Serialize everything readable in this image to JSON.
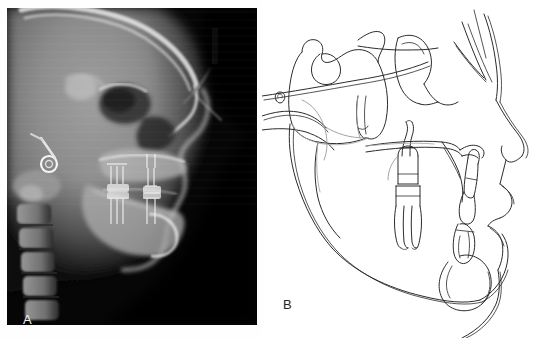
{
  "figure": {
    "type": "two-panel medical imaging figure",
    "background_color": "#fefefe",
    "width": 546,
    "height": 338
  },
  "panel_a": {
    "label": "A",
    "label_color": "#efefef",
    "caption_position": "bottom-left",
    "modality": "lateral cephalometric radiograph",
    "background_color": "#000000",
    "frame": {
      "x": 7,
      "y": 8,
      "width": 250,
      "height": 317
    },
    "anatomy_visible": [
      "cranial vault",
      "frontal sinus",
      "orbit",
      "sella turcica",
      "nasal airway",
      "maxilla",
      "maxillary incisors",
      "mandibular incisors",
      "mandible",
      "mandibular symphysis",
      "cervical vertebrae",
      "ear rod ring marker",
      "soft tissue profile"
    ],
    "markers": {
      "ear_rod_ring": "circular metallic ear-rod artifact at left mid-height",
      "calibration_ruler": "vertical light-grey scale bar near upper right"
    }
  },
  "panel_b": {
    "label": "B",
    "label_color": "#262626",
    "caption_position": "bottom-left",
    "modality": "cephalometric line tracing",
    "background_color": "#ffffff",
    "line_color": "#2b2b2b",
    "structures_traced": [
      "cranial base",
      "sella turcica",
      "clivus",
      "anterior cranial floor",
      "orbital outline",
      "pterygomaxillary fissure",
      "nasal floor / palatal plane",
      "maxillary first molar",
      "mandibular first molar",
      "maxillary central incisor",
      "mandibular central incisor",
      "mandibular body and ramus",
      "gonial angle",
      "symphysis",
      "soft tissue profile",
      "nasal dorsum",
      "upper lip",
      "lower lip",
      "chin",
      "external auditory meatus"
    ]
  }
}
